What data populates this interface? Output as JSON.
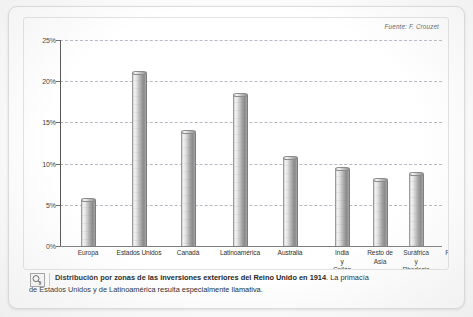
{
  "source_note": "Fuente: F. Crouzet",
  "chart_data": {
    "type": "bar",
    "title": "",
    "xlabel": "",
    "ylabel": "",
    "ylim": [
      0,
      25
    ],
    "ytick_labels": [
      "0%",
      "5%",
      "10%",
      "15%",
      "20%",
      "25%"
    ],
    "ytick_values": [
      0,
      5,
      10,
      15,
      20,
      25
    ],
    "grid": true,
    "legend": null,
    "categories": [
      "Europa",
      "Estados Unidos",
      "Canadá",
      "Latinoamérica",
      "Australia",
      "India\ny\nCeilán",
      "Resto de\nAsia",
      "Suráfrica\ny\nRhodesia",
      "Resto de\nÁfrica"
    ],
    "values": [
      5.6,
      21.0,
      13.8,
      18.3,
      10.7,
      9.3,
      8.0,
      8.7,
      2.4
    ],
    "annotations": [
      "Fuente: F. Crouzet"
    ]
  },
  "caption": {
    "bold": "Distribución por zonas de las inversiones exteriores del Reino Unido en 1914",
    "rest": ". La primacía",
    "line2": "de Estados Unidos y de Latinoamérica resulta especialmente llamativa."
  }
}
